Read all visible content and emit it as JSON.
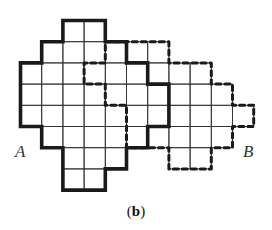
{
  "figure": {
    "caption_open": "(",
    "caption_letter": "b",
    "caption_close": ")",
    "labels": {
      "a": "A",
      "b": "B"
    },
    "grid": {
      "origin_x": 20.5,
      "origin_y": 20.5,
      "cell": 21.2
    },
    "colors": {
      "grid_line": "#333333",
      "solid_outline": "#1a1a1a",
      "dashed_outline": "#1a1a1a",
      "background": "#ffffff"
    },
    "shape_a": {
      "name": "solid-polyomino-A",
      "style": "solid",
      "outline": [
        [
          2,
          0
        ],
        [
          4,
          0
        ],
        [
          4,
          1
        ],
        [
          5,
          1
        ],
        [
          5,
          2
        ],
        [
          6,
          2
        ],
        [
          6,
          3
        ],
        [
          7,
          3
        ],
        [
          7,
          5
        ],
        [
          6,
          5
        ],
        [
          6,
          6
        ],
        [
          5,
          6
        ],
        [
          5,
          7
        ],
        [
          4,
          7
        ],
        [
          4,
          8
        ],
        [
          2,
          8
        ],
        [
          2,
          6
        ],
        [
          1,
          6
        ],
        [
          1,
          5
        ],
        [
          0,
          5
        ],
        [
          0,
          2
        ],
        [
          1,
          2
        ],
        [
          1,
          1
        ],
        [
          2,
          1
        ]
      ],
      "cells_by_row": [
        [
          2,
          3
        ],
        [
          1,
          2,
          3,
          4
        ],
        [
          0,
          1,
          2,
          3,
          4,
          5
        ],
        [
          0,
          1,
          2,
          3,
          4,
          5,
          6
        ],
        [
          0,
          1,
          2,
          3,
          4,
          5,
          6
        ],
        [
          1,
          2,
          3,
          4,
          5
        ],
        [
          2,
          3,
          4
        ],
        [
          2,
          3
        ]
      ]
    },
    "shape_b": {
      "name": "dashed-polyomino-B",
      "style": "dashed",
      "outline": [
        [
          4,
          1
        ],
        [
          7,
          1
        ],
        [
          7,
          2
        ],
        [
          9,
          2
        ],
        [
          9,
          3
        ],
        [
          10,
          3
        ],
        [
          10,
          4
        ],
        [
          11,
          4
        ],
        [
          11,
          5
        ],
        [
          10,
          5
        ],
        [
          10,
          6
        ],
        [
          9,
          6
        ],
        [
          9,
          7
        ],
        [
          7,
          7
        ],
        [
          7,
          6
        ],
        [
          5,
          6
        ],
        [
          5,
          4
        ],
        [
          4,
          4
        ],
        [
          4,
          3
        ],
        [
          3,
          3
        ],
        [
          3,
          2
        ],
        [
          4,
          2
        ]
      ],
      "cells_by_row": [
        [],
        [
          4,
          5,
          6
        ],
        [
          3,
          4,
          5,
          6,
          7,
          8
        ],
        [
          4,
          5,
          6,
          7,
          8,
          9
        ],
        [
          5,
          6,
          7,
          8,
          9,
          10
        ],
        [
          5,
          6,
          7,
          8,
          9
        ],
        [
          7,
          8
        ],
        []
      ]
    }
  }
}
